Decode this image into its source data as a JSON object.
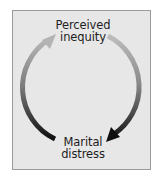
{
  "diagram": {
    "type": "cycle",
    "nodes": [
      {
        "id": "perceived-inequity",
        "lines": [
          "Perceived",
          "inequity"
        ],
        "position": "top"
      },
      {
        "id": "marital-distress",
        "lines": [
          "Marital",
          "distress"
        ],
        "position": "bottom"
      }
    ],
    "edges": [
      {
        "from": "perceived-inequity",
        "to": "marital-distress",
        "side": "right",
        "direction": "clockwise"
      },
      {
        "from": "marital-distress",
        "to": "perceived-inequity",
        "side": "left",
        "direction": "clockwise"
      }
    ],
    "colors": {
      "panel_fill": "#e7e7e7",
      "panel_border": "#9a9a9a",
      "arrow_start": "#b8b8b8",
      "arrow_end": "#111111",
      "text": "#1e1e1e"
    }
  }
}
